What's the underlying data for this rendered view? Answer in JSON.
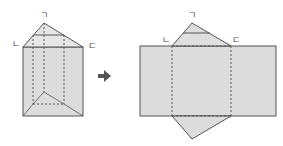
{
  "diagram": {
    "colors": {
      "fill": "#dcdcdc",
      "fill_light": "#e4e4e4",
      "stroke": "#555555",
      "arrow": "#555555"
    },
    "prism": {
      "labels": {
        "apex": "ㄱ",
        "left": "ㄴ",
        "right": "ㄷ"
      }
    },
    "arrow": {
      "glyph": "➔"
    },
    "net": {
      "labels": {
        "apex": "ㄱ",
        "left": "ㄴ",
        "right": "ㄷ"
      }
    }
  }
}
